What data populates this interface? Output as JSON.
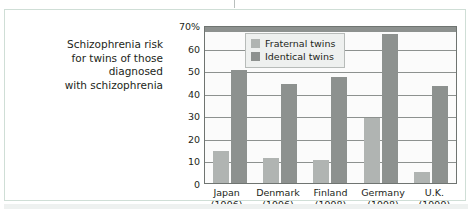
{
  "caption": {
    "lines": [
      "Schizophrenia risk",
      "for twins of those",
      "diagnosed",
      "with schizophrenia"
    ]
  },
  "legend": {
    "items": [
      {
        "label": "Fraternal twins",
        "color": "#b0b4b2"
      },
      {
        "label": "Identical twins",
        "color": "#8d918f"
      }
    ]
  },
  "axis": {
    "y_ticks": [
      "70%",
      "60",
      "50",
      "40",
      "30",
      "20",
      "10",
      "0"
    ]
  },
  "chart_data": {
    "type": "bar",
    "title": "",
    "subtitle": "",
    "xlabel": "",
    "ylabel": "",
    "ylim": [
      0,
      70
    ],
    "ytick_values": [
      0,
      10,
      20,
      30,
      40,
      50,
      60,
      70
    ],
    "ytick_labels": [
      "0",
      "10",
      "20",
      "30",
      "40",
      "50",
      "60",
      "70%"
    ],
    "grid": true,
    "legend_position": "top-left inside plot",
    "categories": [
      "Japan\n(1996)",
      "Denmark\n(1996)",
      "Finland\n(1998)",
      "Germany\n(1998)",
      "U.K.\n(1999)"
    ],
    "category_labels": [
      {
        "name": "Japan",
        "year": "(1996)"
      },
      {
        "name": "Denmark",
        "year": "(1996)"
      },
      {
        "name": "Finland",
        "year": "(1998)"
      },
      {
        "name": "Germany",
        "year": "(1998)"
      },
      {
        "name": "U.K.",
        "year": "(1999)"
      }
    ],
    "series": [
      {
        "name": "Fraternal twins",
        "color": "#b0b4b2",
        "values": [
          14,
          11,
          10,
          29,
          5
        ]
      },
      {
        "name": "Identical twins",
        "color": "#8d918f",
        "values": [
          50,
          44,
          47,
          66,
          43
        ]
      }
    ]
  },
  "colors": {
    "card_border": "#cfded6",
    "plot_border": "#6f7471",
    "gridline": "#8d918f",
    "text": "#231f20"
  }
}
